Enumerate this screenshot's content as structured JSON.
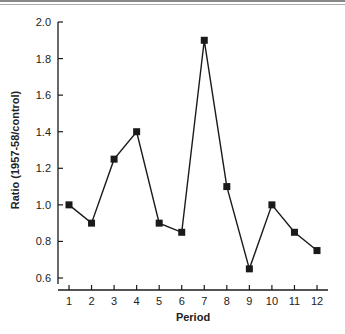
{
  "chart_data": {
    "type": "line",
    "title": "",
    "xlabel": "Period",
    "ylabel": "Ratio (1957-58/control)",
    "x": [
      1,
      2,
      3,
      4,
      5,
      6,
      7,
      8,
      9,
      10,
      11,
      12
    ],
    "values": [
      1.0,
      0.9,
      1.25,
      1.4,
      0.9,
      0.85,
      1.9,
      1.1,
      0.65,
      1.0,
      0.85,
      0.75
    ],
    "xticks": [
      "1",
      "2",
      "3",
      "4",
      "5",
      "6",
      "7",
      "8",
      "9",
      "10",
      "11",
      "12"
    ],
    "yticks": [
      "0.6",
      "0.8",
      "1.0",
      "1.2",
      "1.4",
      "1.6",
      "1.8",
      "2.0"
    ],
    "ylim": [
      0.6,
      2.0
    ],
    "xlim": [
      1,
      12
    ],
    "marker": "square",
    "grid": false,
    "line_color": "#1a1a1a"
  }
}
